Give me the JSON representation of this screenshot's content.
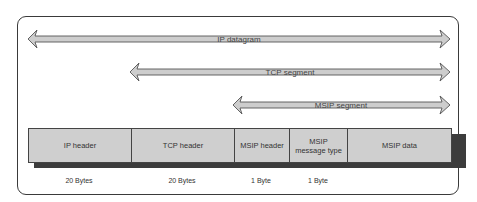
{
  "diagram": {
    "type": "packet-encapsulation",
    "arrows": [
      {
        "label": "IP datagram",
        "x1": 28,
        "x2": 450,
        "y": 39
      },
      {
        "label": "TCP segment",
        "x1": 130,
        "x2": 450,
        "y": 72
      },
      {
        "label": "MSIP segment",
        "x1": 233,
        "x2": 450,
        "y": 105
      }
    ],
    "fields": [
      {
        "label": "IP header",
        "size": "20 Bytes"
      },
      {
        "label": "TCP header",
        "size": "20 Bytes"
      },
      {
        "label": "MSIP header",
        "size": "1 Byte"
      },
      {
        "label": "MSIP message type",
        "size": "1 Byte"
      },
      {
        "label": "MSIP data",
        "size": ""
      }
    ],
    "colors": {
      "arrow_fill": "#cdcdcd",
      "arrow_stroke": "#555555",
      "box_fill": "#cfcfcf",
      "shadow": "#3c3c3c",
      "frame": "#3a3a3a"
    }
  }
}
